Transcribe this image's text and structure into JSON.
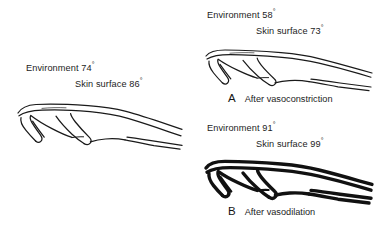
{
  "figure": {
    "background_color": "#ffffff",
    "line_color": "#1a1a1a",
    "panels": [
      {
        "id": "normal",
        "environment_label": "Environment 74",
        "environment_value": 74,
        "skin_surface_label": "Skin surface 86",
        "skin_surface_value": 86,
        "degree_symbol": "°",
        "units": "°F",
        "panel_letter": "",
        "caption": "",
        "vessel_state": "normal",
        "stroke_weight": "thin",
        "illustration": "hand-outline-side-view"
      },
      {
        "id": "a",
        "environment_label": "Environment 58",
        "environment_value": 58,
        "skin_surface_label": "Skin surface 73",
        "skin_surface_value": 73,
        "degree_symbol": "°",
        "units": "°F",
        "panel_letter": "A",
        "caption": "After vasoconstriction",
        "vessel_state": "constricted",
        "stroke_weight": "thin",
        "illustration": "hand-outline-side-view"
      },
      {
        "id": "b",
        "environment_label": "Environment 91",
        "environment_value": 91,
        "skin_surface_label": "Skin surface 99",
        "skin_surface_value": 99,
        "degree_symbol": "°",
        "units": "°F",
        "panel_letter": "B",
        "caption": "After vasodilation",
        "vessel_state": "dilated",
        "stroke_weight": "bold",
        "illustration": "hand-outline-side-view"
      }
    ]
  }
}
